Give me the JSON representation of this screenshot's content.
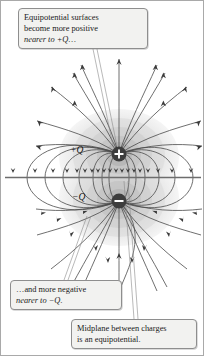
{
  "figure": {
    "name": "electric-dipole-equipotential-diagram",
    "background": "#ffffff",
    "border_color": "#a9a9a9"
  },
  "callouts": [
    {
      "id": "callout-top",
      "lines": [
        "Equipotential surfaces",
        "become more positive",
        "nearer to  +Q…"
      ],
      "points_to": "positive-charge-region"
    },
    {
      "id": "callout-negative",
      "lines": [
        "…and more negative",
        "nearer to −Q."
      ],
      "points_to": "negative-charge-region"
    },
    {
      "id": "callout-midplane",
      "lines": [
        "Midplane between charges",
        "is an equipotential."
      ],
      "points_to": "midplane-line"
    }
  ],
  "charges": [
    {
      "id": "positive-charge",
      "label": "+Q",
      "sign": "+",
      "cx": 118,
      "cy": 153,
      "r": 7.5,
      "fill": "#3d3d3d"
    },
    {
      "id": "negative-charge",
      "label": "−Q",
      "sign": "−",
      "cx": 118,
      "cy": 200,
      "r": 7.5,
      "fill": "#3d3d3d"
    }
  ],
  "midplane": {
    "id": "midplane-line",
    "y": 176.5,
    "x_start": 4,
    "x_end": 200,
    "color": "#6d6d6d",
    "arrow_count": 19,
    "arrow_direction": "down"
  },
  "equipotentials": {
    "description": "nested shaded surfaces around each charge",
    "fill_light": "#e4e4e4",
    "fill_mid": "#cfcfcf",
    "fill_dark": "#b4b4b4",
    "shell_count": 6
  },
  "field_lines": {
    "color": "#4a4a4a",
    "arrow_color": "#3a3a3a",
    "count": 34,
    "direction": "from positive charge to negative charge"
  },
  "colors": {
    "line": "#4a4a4a",
    "text": "#1a1a1a",
    "callout_bg": "#f2f2f0",
    "callout_border": "#8e8e8e",
    "charge_fill": "#3d3d3d"
  }
}
